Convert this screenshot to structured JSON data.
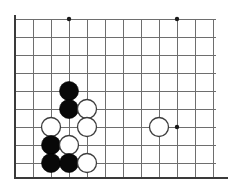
{
  "figure": {
    "kind": "go-board-diagram",
    "width": 244,
    "height": 195,
    "background_color": "#ffffff"
  },
  "board": {
    "orientation": "bottom-left-corner",
    "visible_columns": 12,
    "visible_rows": 10,
    "origin_x": 15,
    "origin_y": 19,
    "spacing": 18,
    "line_color": "#6e6e6e",
    "edge_color": "#3a3a3a",
    "edge_line_width": 2.4,
    "grid_line_width": 1,
    "left_edge_x": 15,
    "bottom_edge_y": 178,
    "grid_right_x": 213,
    "grid_top_y": 19,
    "column_x": [
      15,
      33,
      51,
      69,
      87,
      105,
      123,
      141,
      159,
      177,
      195,
      213
    ],
    "row_y": [
      19,
      37,
      55,
      73,
      91,
      109,
      127,
      145,
      163
    ],
    "horizontal_line_right_ends": [
      216,
      216,
      216,
      216,
      216,
      216,
      216,
      216,
      216
    ],
    "vertical_line_bottom_y": 178
  },
  "star_points": {
    "radius": 2.2,
    "color": "#1a1a1a",
    "points": [
      {
        "label": "star-top-left",
        "x": 69,
        "y": 19
      },
      {
        "label": "star-top-right",
        "x": 177,
        "y": 19
      },
      {
        "label": "star-bottom-right",
        "x": 177,
        "y": 127
      }
    ]
  },
  "stones": {
    "radius": 9.5,
    "black_color": "#080808",
    "white_color": "#ffffff",
    "white_outline_color": "#3d3d3d",
    "black_count": 5,
    "white_count": 6,
    "list": [
      {
        "label": "black-stone-1",
        "color": "black",
        "x": 69,
        "y": 91
      },
      {
        "label": "black-stone-2",
        "color": "black",
        "x": 69,
        "y": 109
      },
      {
        "label": "white-stone-1",
        "color": "white",
        "x": 87,
        "y": 109
      },
      {
        "label": "white-stone-2",
        "color": "white",
        "x": 51,
        "y": 127
      },
      {
        "label": "white-stone-3",
        "color": "white",
        "x": 87,
        "y": 127
      },
      {
        "label": "black-stone-3",
        "color": "black",
        "x": 51,
        "y": 145
      },
      {
        "label": "white-stone-4",
        "color": "white",
        "x": 69,
        "y": 145
      },
      {
        "label": "black-stone-4",
        "color": "black",
        "x": 51,
        "y": 163
      },
      {
        "label": "black-stone-5",
        "color": "black",
        "x": 69,
        "y": 163
      },
      {
        "label": "white-stone-5",
        "color": "white",
        "x": 87,
        "y": 163
      },
      {
        "label": "white-stone-6",
        "color": "white",
        "x": 159,
        "y": 127
      }
    ]
  }
}
